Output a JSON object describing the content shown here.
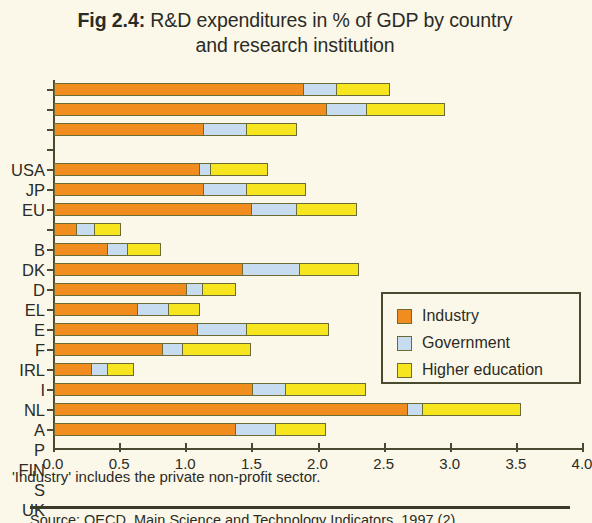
{
  "title": {
    "fignum": "Fig 2.4:",
    "line1": " R&D expenditures in % of GDP by country",
    "line2": "and research institution"
  },
  "legend": {
    "items": [
      {
        "label": "Industry",
        "color": "#F18C1F",
        "key": "industry"
      },
      {
        "label": "Government",
        "color": "#C7DCEF",
        "key": "government"
      },
      {
        "label": "Higher education",
        "color": "#F7E520",
        "key": "higher_education"
      }
    ]
  },
  "footnote": "'Industry' includes the private non-profit sector.",
  "source": "Source: OECD, Main Science and Technology Indicators, 1997 (2)",
  "axis": {
    "x_ticks": [
      "0.0",
      "0.5",
      "1.0",
      "1.5",
      "2.0",
      "2.5",
      "3.0",
      "3.5",
      "4.0"
    ]
  },
  "chart_data": {
    "type": "bar",
    "orientation": "horizontal",
    "stacked": true,
    "title": "Fig 2.4: R&D expenditures in % of GDP by country and research institution",
    "xlabel": "",
    "ylabel": "",
    "xlim": [
      0.0,
      4.0
    ],
    "xticks": [
      0.0,
      0.5,
      1.0,
      1.5,
      2.0,
      2.5,
      3.0,
      3.5,
      4.0
    ],
    "grid": false,
    "legend_position": "inside-right",
    "categories": [
      "USA",
      "JP",
      "EU",
      "",
      "B",
      "DK",
      "D",
      "EL",
      "E",
      "F",
      "IRL",
      "I",
      "NL",
      "A",
      "P",
      "FIN",
      "S",
      "UK"
    ],
    "series": [
      {
        "name": "Industry",
        "color": "#F18C1F",
        "values": [
          1.88,
          2.06,
          1.13,
          null,
          1.1,
          1.13,
          1.49,
          0.17,
          0.4,
          1.42,
          1.0,
          0.63,
          1.08,
          0.82,
          0.28,
          1.5,
          2.67,
          1.37
        ]
      },
      {
        "name": "Government",
        "color": "#C7DCEF",
        "values": [
          0.25,
          0.3,
          0.32,
          null,
          0.08,
          0.32,
          0.34,
          0.13,
          0.15,
          0.43,
          0.12,
          0.23,
          0.37,
          0.15,
          0.12,
          0.25,
          0.11,
          0.3
        ]
      },
      {
        "name": "Higher education",
        "color": "#F7E520",
        "values": [
          0.4,
          0.59,
          0.38,
          null,
          0.43,
          0.45,
          0.45,
          0.2,
          0.25,
          0.45,
          0.25,
          0.24,
          0.62,
          0.51,
          0.2,
          0.6,
          0.74,
          0.38
        ]
      }
    ],
    "totals": [
      2.53,
      2.95,
      1.83,
      null,
      1.61,
      1.9,
      2.28,
      0.5,
      0.8,
      2.3,
      1.37,
      1.1,
      2.07,
      1.48,
      0.6,
      2.35,
      3.52,
      2.05
    ]
  }
}
